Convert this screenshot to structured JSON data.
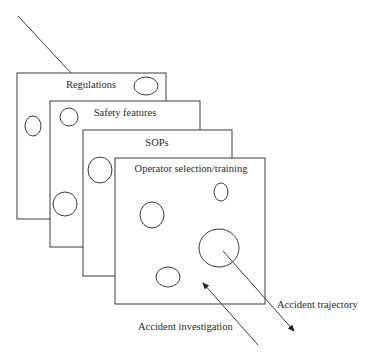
{
  "diagram": {
    "layers": [
      {
        "label": "Regulations"
      },
      {
        "label": "Safety features"
      },
      {
        "label": "SOPs"
      },
      {
        "label": "Operator selection/training"
      }
    ],
    "arrows": {
      "trajectory_label": "Accident trajectory",
      "investigation_label": "Accident investigation"
    }
  }
}
